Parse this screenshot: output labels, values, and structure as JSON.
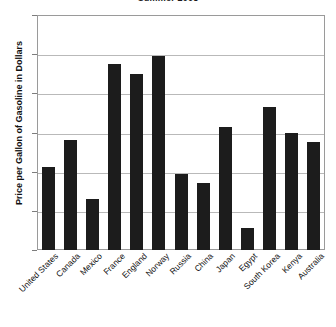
{
  "chart_data": {
    "type": "bar",
    "title": "Summer 2008",
    "xlabel": "",
    "ylabel": "Price per Gallon of Gasoline in Dollars",
    "ylim": [
      0,
      12
    ],
    "ytick_labels": [
      "12",
      "10",
      "8",
      "6",
      "4",
      "2",
      "0"
    ],
    "yticks": [
      12,
      10,
      8,
      6,
      4,
      2,
      0
    ],
    "grid": true,
    "legend": null,
    "bar_color": "#1c1c1c",
    "categories": [
      "United States",
      "Canada",
      "Mexico",
      "France",
      "England",
      "Norway",
      "Russia",
      "China",
      "Japan",
      "Egypt",
      "South Korea",
      "Kenya",
      "Australia"
    ],
    "values": [
      4.25,
      5.6,
      2.6,
      9.5,
      9.0,
      9.9,
      3.9,
      3.4,
      6.3,
      1.1,
      7.3,
      5.95,
      5.5
    ]
  }
}
